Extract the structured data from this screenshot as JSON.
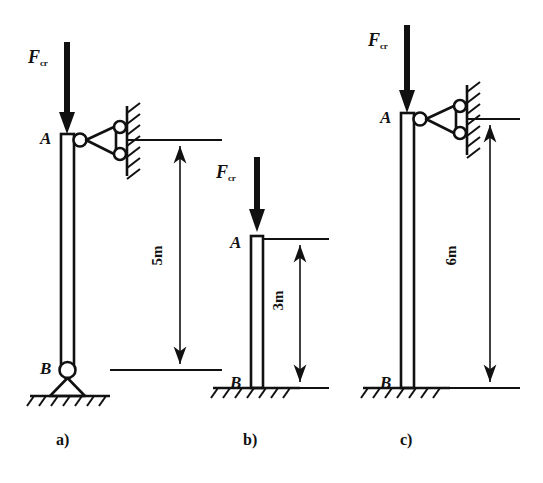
{
  "figure": {
    "background_color": "#ffffff",
    "ink_color": "#111111",
    "panels": [
      {
        "id": "a",
        "caption": "a)",
        "force_label": {
          "symbol": "F",
          "subscript": "cr"
        },
        "top_node": "A",
        "bottom_node": "B",
        "dimension": "5m",
        "top_support": "roller-link-to-wall",
        "bottom_support": "pinned",
        "column_length_m": 5
      },
      {
        "id": "b",
        "caption": "b)",
        "force_label": {
          "symbol": "F",
          "subscript": "cr"
        },
        "top_node": "A",
        "bottom_node": "B",
        "dimension": "3m",
        "top_support": "free",
        "bottom_support": "fixed",
        "column_length_m": 3
      },
      {
        "id": "c",
        "caption": "c)",
        "force_label": {
          "symbol": "F",
          "subscript": "cr"
        },
        "top_node": "A",
        "bottom_node": "B",
        "dimension": "6m",
        "top_support": "roller-link-to-wall",
        "bottom_support": "fixed",
        "column_length_m": 6
      }
    ]
  }
}
